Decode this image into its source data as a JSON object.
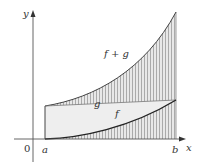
{
  "figure": {
    "type": "area-under-curves diagram",
    "axes": {
      "x_label": "x",
      "y_label": "y",
      "origin_label": "0",
      "tick_labels": [
        "a",
        "b"
      ]
    },
    "curves": [
      {
        "name": "f",
        "label": "f",
        "description": "lower increasing curve from x-axis at a"
      },
      {
        "name": "g",
        "label": "g",
        "description": "light shaded band between f and f+g"
      },
      {
        "name": "f_plus_g",
        "label": "f + g",
        "description": "upper increasing curve"
      }
    ],
    "colors": {
      "axis": "#555555",
      "curve": "#333333",
      "hatch": "#9a9a9a",
      "hatch_fill": "#e6e6e6",
      "band_fill": "#ededed"
    }
  }
}
